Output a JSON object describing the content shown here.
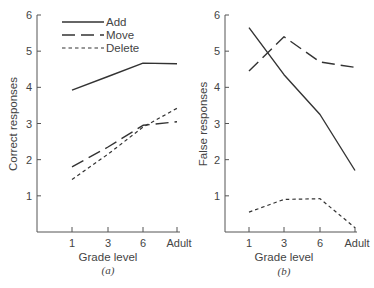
{
  "chart_data": [
    {
      "type": "line",
      "panel": "(a)",
      "title": "",
      "xlabel": "Grade level",
      "ylabel": "Correct responses",
      "categories": [
        "1",
        "3",
        "6",
        "Adult"
      ],
      "ylim": [
        0,
        6
      ],
      "yticks": [
        "1",
        "2",
        "3",
        "4",
        "5",
        "6"
      ],
      "grid": false,
      "legend": {
        "position": "upper-left",
        "entries": [
          "Add",
          "Move",
          "Delete"
        ]
      },
      "series": [
        {
          "name": "Add",
          "style": "solid",
          "values": [
            3.92,
            4.3,
            4.67,
            4.65
          ]
        },
        {
          "name": "Move",
          "style": "long-dash",
          "values": [
            1.8,
            2.35,
            2.95,
            3.05
          ]
        },
        {
          "name": "Delete",
          "style": "short-dash",
          "values": [
            1.45,
            2.15,
            2.9,
            3.42
          ]
        }
      ]
    },
    {
      "type": "line",
      "panel": "(b)",
      "title": "",
      "xlabel": "Grade level",
      "ylabel": "False responses",
      "categories": [
        "1",
        "3",
        "6",
        "Adult"
      ],
      "ylim": [
        0,
        6
      ],
      "yticks": [
        "1",
        "2",
        "3",
        "4",
        "5",
        "6"
      ],
      "grid": false,
      "series": [
        {
          "name": "Add",
          "style": "solid",
          "values": [
            5.65,
            4.35,
            3.25,
            1.7
          ]
        },
        {
          "name": "Move",
          "style": "long-dash",
          "values": [
            4.45,
            5.4,
            4.7,
            4.55
          ]
        },
        {
          "name": "Delete",
          "style": "short-dash",
          "values": [
            0.55,
            0.9,
            0.92,
            0.12
          ]
        }
      ]
    }
  ],
  "labels": {
    "a": {
      "xlabel": "Grade level",
      "ylabel": "Correct responses",
      "panel": "(a)"
    },
    "b": {
      "xlabel": "Grade level",
      "ylabel": "False responses",
      "panel": "(b)"
    },
    "xticks": [
      "1",
      "3",
      "6",
      "Adult"
    ],
    "yticks": [
      "1",
      "2",
      "3",
      "4",
      "5",
      "6"
    ],
    "legend": [
      "Add",
      "Move",
      "Delete"
    ]
  }
}
